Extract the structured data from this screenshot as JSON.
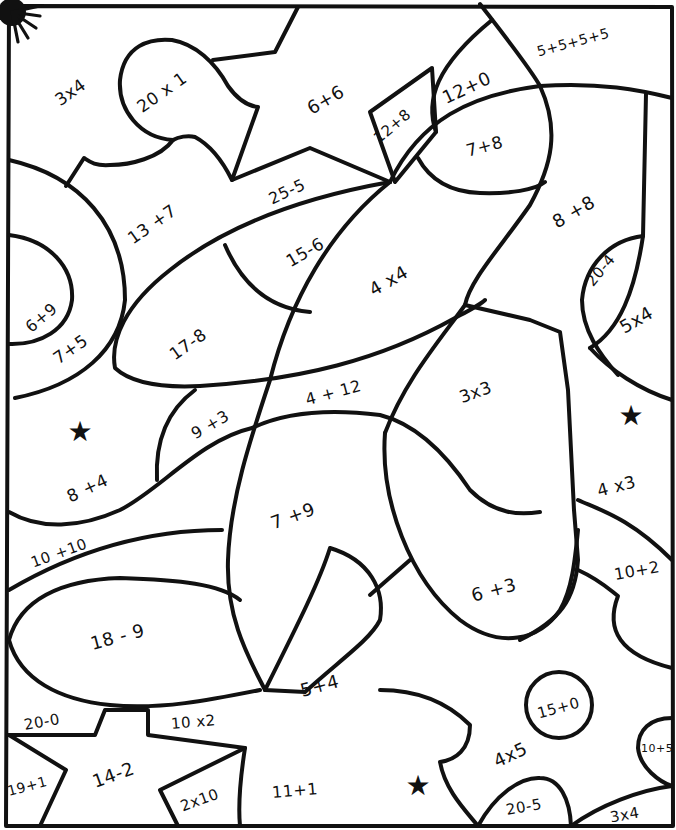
{
  "worksheet": {
    "type": "color-by-number math puzzle",
    "border_color": "#111111",
    "background": "#ffffff"
  },
  "regions": [
    {
      "label": "3x4",
      "x": 70,
      "y": 92,
      "rot": -35,
      "size": 17
    },
    {
      "label": "20 x 1",
      "x": 162,
      "y": 92,
      "rot": -35,
      "size": 17
    },
    {
      "label": "6+6",
      "x": 326,
      "y": 100,
      "rot": -30,
      "size": 18
    },
    {
      "label": "12+0",
      "x": 466,
      "y": 88,
      "rot": -25,
      "size": 18
    },
    {
      "label": "5+5+5+5",
      "x": 573,
      "y": 42,
      "rot": -15,
      "size": 14
    },
    {
      "label": "12+8",
      "x": 392,
      "y": 126,
      "rot": -40,
      "size": 15
    },
    {
      "label": "7+8",
      "x": 484,
      "y": 146,
      "rot": -15,
      "size": 17
    },
    {
      "label": "25-5",
      "x": 287,
      "y": 192,
      "rot": -25,
      "size": 16
    },
    {
      "label": "13 +7",
      "x": 152,
      "y": 224,
      "rot": -35,
      "size": 17
    },
    {
      "label": "15-6",
      "x": 305,
      "y": 252,
      "rot": -30,
      "size": 17
    },
    {
      "label": "8 +8",
      "x": 574,
      "y": 212,
      "rot": -30,
      "size": 18
    },
    {
      "label": "20-4",
      "x": 601,
      "y": 270,
      "rot": -50,
      "size": 15
    },
    {
      "label": "4 x4",
      "x": 388,
      "y": 281,
      "rot": -30,
      "size": 18
    },
    {
      "label": "5x4",
      "x": 636,
      "y": 320,
      "rot": -30,
      "size": 18
    },
    {
      "label": "6+9",
      "x": 41,
      "y": 318,
      "rot": -40,
      "size": 16
    },
    {
      "label": "7+5",
      "x": 70,
      "y": 349,
      "rot": -35,
      "size": 17
    },
    {
      "label": "17-8",
      "x": 188,
      "y": 344,
      "rot": -35,
      "size": 17
    },
    {
      "label": "4 + 12",
      "x": 333,
      "y": 393,
      "rot": -15,
      "size": 16
    },
    {
      "label": "3x3",
      "x": 475,
      "y": 392,
      "rot": -20,
      "size": 17
    },
    {
      "label": "9 +3",
      "x": 210,
      "y": 425,
      "rot": -30,
      "size": 16
    },
    {
      "label": "8 +4",
      "x": 87,
      "y": 488,
      "rot": -25,
      "size": 17
    },
    {
      "label": "4 x3",
      "x": 616,
      "y": 486,
      "rot": -15,
      "size": 17
    },
    {
      "label": "7 +9",
      "x": 293,
      "y": 516,
      "rot": -20,
      "size": 18
    },
    {
      "label": "10 +10",
      "x": 59,
      "y": 553,
      "rot": -20,
      "size": 15
    },
    {
      "label": "10+2",
      "x": 637,
      "y": 571,
      "rot": -10,
      "size": 16
    },
    {
      "label": "6 +3",
      "x": 494,
      "y": 590,
      "rot": -15,
      "size": 18
    },
    {
      "label": "18 - 9",
      "x": 117,
      "y": 637,
      "rot": -15,
      "size": 18
    },
    {
      "label": "5+4",
      "x": 320,
      "y": 686,
      "rot": -15,
      "size": 18
    },
    {
      "label": "15+0",
      "x": 558,
      "y": 708,
      "rot": -15,
      "size": 15
    },
    {
      "label": "20-0",
      "x": 42,
      "y": 722,
      "rot": -10,
      "size": 15
    },
    {
      "label": "10 x2",
      "x": 193,
      "y": 722,
      "rot": -5,
      "size": 15
    },
    {
      "label": "4x5",
      "x": 510,
      "y": 755,
      "rot": -25,
      "size": 18
    },
    {
      "label": "10+5",
      "x": 657,
      "y": 748,
      "rot": 0,
      "size": 11
    },
    {
      "label": "14-2",
      "x": 113,
      "y": 775,
      "rot": -20,
      "size": 18
    },
    {
      "label": "19+1",
      "x": 27,
      "y": 786,
      "rot": -15,
      "size": 14
    },
    {
      "label": "11+1",
      "x": 295,
      "y": 791,
      "rot": -5,
      "size": 16
    },
    {
      "label": "2x10",
      "x": 200,
      "y": 800,
      "rot": -20,
      "size": 15
    },
    {
      "label": "20-5",
      "x": 524,
      "y": 807,
      "rot": -10,
      "size": 15
    },
    {
      "label": "3x4",
      "x": 624,
      "y": 815,
      "rot": -10,
      "size": 15
    }
  ],
  "decorations": [
    {
      "name": "star",
      "glyph": "★",
      "x": 80,
      "y": 432
    },
    {
      "name": "star",
      "glyph": "★",
      "x": 631,
      "y": 416
    },
    {
      "name": "star",
      "glyph": "★",
      "x": 418,
      "y": 786
    }
  ]
}
